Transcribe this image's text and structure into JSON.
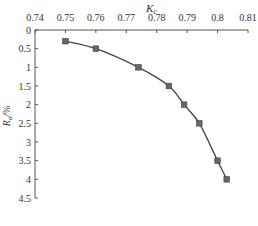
{
  "chart_data": {
    "type": "line",
    "title": "",
    "xlabel": "K",
    "xlabel_sub": "c",
    "ylabel": "R",
    "ylabel_sub": "a",
    "ylabel_suffix": "/%",
    "x_axis_position": "top",
    "y_axis_inverted": true,
    "xlim": [
      0.74,
      0.81
    ],
    "ylim": [
      0,
      4.5
    ],
    "x_ticks": [
      "0.74",
      "0.75",
      "0.76",
      "0.77",
      "0.78",
      "0.79",
      "0.8",
      "0.81"
    ],
    "y_ticks": [
      "0",
      "0.5",
      "1",
      "1.5",
      "2",
      "2.5",
      "3",
      "3.5",
      "4",
      "4.5"
    ],
    "grid": false,
    "marker": "square",
    "series": [
      {
        "name": "Ra vs Kc",
        "color": "#555555",
        "x": [
          0.75,
          0.76,
          0.774,
          0.784,
          0.789,
          0.794,
          0.8,
          0.803
        ],
        "y": [
          0.3,
          0.5,
          1.0,
          1.5,
          2.0,
          2.5,
          3.5,
          4.0
        ]
      }
    ]
  }
}
